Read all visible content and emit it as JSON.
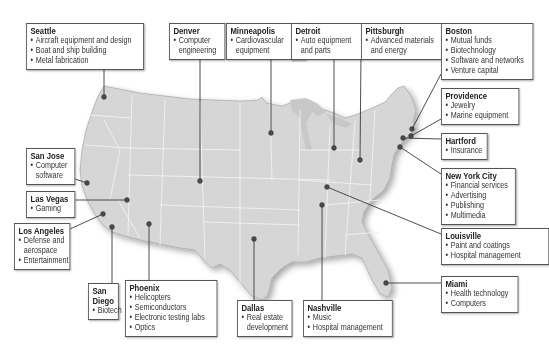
{
  "colors": {
    "land": "#d6d6d6",
    "state_borders": "#f2f2f2",
    "leader_lines": "#3a3a3a",
    "dots": "#4a4a4a",
    "box_border": "#555555"
  },
  "cities": [
    {
      "id": "seattle",
      "name": "Seattle",
      "items": [
        "Aircraft equipment and design",
        "Boat and ship building",
        "Metal fabrication"
      ],
      "box": {
        "x": 26,
        "y": 23,
        "w": 118
      },
      "dot": [
        104,
        97
      ]
    },
    {
      "id": "denver",
      "name": "Denver",
      "items": [
        "Computer",
        "engineering"
      ],
      "box": {
        "x": 169,
        "y": 23,
        "w": 56
      },
      "dot": [
        200,
        181
      ],
      "wrap": true
    },
    {
      "id": "minneapolis",
      "name": "Minneapolis",
      "items": [
        "Cardiovascular",
        "equipment"
      ],
      "box": {
        "x": 226,
        "y": 23,
        "w": 80
      },
      "dot": [
        271,
        133
      ],
      "wrap": true
    },
    {
      "id": "detroit",
      "name": "Detroit",
      "items": [
        "Auto equipment",
        "and parts"
      ],
      "box": {
        "x": 291,
        "y": 23,
        "w": 71
      },
      "dot": [
        334,
        148
      ],
      "wrap": true
    },
    {
      "id": "pittsburgh",
      "name": "Pittsburgh",
      "items": [
        "Advanced materials",
        "and energy"
      ],
      "box": {
        "x": 361,
        "y": 23,
        "w": 82
      },
      "dot": [
        360,
        160
      ],
      "wrap": true
    },
    {
      "id": "boston",
      "name": "Boston",
      "items": [
        "Mutual funds",
        "Biotechnology",
        "Software and networks",
        "Venture capital"
      ],
      "box": {
        "x": 441,
        "y": 23,
        "w": 92
      },
      "dot": [
        412,
        129
      ]
    },
    {
      "id": "providence",
      "name": "Providence",
      "items": [
        "Jewelry",
        "Marine equipment"
      ],
      "box": {
        "x": 441,
        "y": 88,
        "w": 78
      },
      "dot": [
        411,
        136
      ]
    },
    {
      "id": "hartford",
      "name": "Hartford",
      "items": [
        "Insurance"
      ],
      "box": {
        "x": 441,
        "y": 133,
        "w": 47
      },
      "dot": [
        403,
        138
      ]
    },
    {
      "id": "nyc",
      "name": "New York City",
      "items": [
        "Financial services",
        "Advertising",
        "Publishing",
        "Multimedia"
      ],
      "box": {
        "x": 441,
        "y": 168,
        "w": 75
      },
      "dot": [
        400,
        147
      ]
    },
    {
      "id": "louisville",
      "name": "Louisville",
      "items": [
        "Paint and coatings",
        "Hospital management"
      ],
      "box": {
        "x": 441,
        "y": 228,
        "w": 108
      },
      "dot": [
        327,
        187
      ]
    },
    {
      "id": "miami",
      "name": "Miami",
      "items": [
        "Health technology",
        "Computers"
      ],
      "box": {
        "x": 441,
        "y": 276,
        "w": 77
      },
      "dot": [
        386,
        283
      ]
    },
    {
      "id": "san_jose",
      "name": "San Jose",
      "items": [
        "Computer",
        "software"
      ],
      "box": {
        "x": 26,
        "y": 148,
        "w": 49
      },
      "dot": [
        87,
        183
      ],
      "wrap": true
    },
    {
      "id": "las_vegas",
      "name": "Las Vegas",
      "items": [
        "Gaming"
      ],
      "box": {
        "x": 26,
        "y": 191,
        "w": 49
      },
      "dot": [
        127,
        200
      ]
    },
    {
      "id": "los_angeles",
      "name": "Los Angeles",
      "items": [
        "Defense and",
        "aerospace",
        "Entertainment"
      ],
      "box": {
        "x": 14,
        "y": 223,
        "w": 56
      },
      "dot": [
        103,
        214
      ],
      "wrap": true
    },
    {
      "id": "san_diego",
      "name": "San Diego",
      "items": [
        "Biotech"
      ],
      "box": {
        "x": 88,
        "y": 283,
        "w": 31
      },
      "dot": [
        112,
        227
      ]
    },
    {
      "id": "phoenix",
      "name": "Phoenix",
      "items": [
        "Helicopters",
        "Semiconductors",
        "Electronic testing labs",
        "Optics"
      ],
      "box": {
        "x": 125,
        "y": 280,
        "w": 92
      },
      "dot": [
        149,
        224
      ]
    },
    {
      "id": "dallas",
      "name": "Dallas",
      "items": [
        "Real estate",
        "development"
      ],
      "box": {
        "x": 237,
        "y": 300,
        "w": 55
      },
      "dot": [
        254,
        239
      ],
      "wrap": true
    },
    {
      "id": "nashville",
      "name": "Nashville",
      "items": [
        "Music",
        "Hospital management"
      ],
      "box": {
        "x": 303,
        "y": 300,
        "w": 90
      },
      "dot": [
        322,
        205
      ]
    }
  ]
}
